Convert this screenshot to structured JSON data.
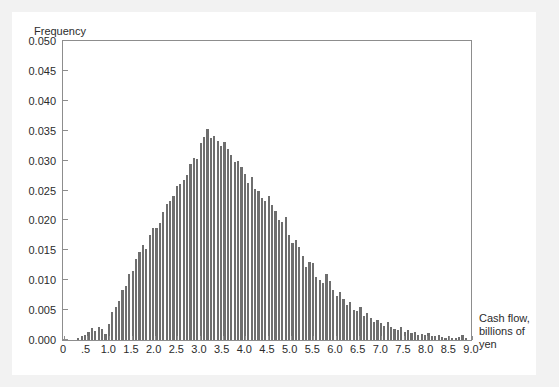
{
  "chart_data": {
    "type": "bar",
    "title": "",
    "annotation": "Year 10: 10,000 Trials",
    "xlabel": "Cash flow, billions of yen",
    "ylabel": "Frequency",
    "xlim": [
      0,
      9.0
    ],
    "ylim": [
      0,
      0.05
    ],
    "grid": false,
    "legend": null,
    "bar_color": "#6e6e6e",
    "frame_color": "#8d8d8d",
    "xtick_labels": [
      "0",
      ".5",
      "1.0",
      "1.5",
      "2.0",
      "2.5",
      "3.0",
      "3.5",
      "4.0",
      "4.5",
      "5.0",
      "5.5",
      "6.0",
      "6.5",
      "7.0",
      "7.5",
      "8.0",
      "8.5",
      "9.0"
    ],
    "xtick_values": [
      0,
      0.5,
      1.0,
      1.5,
      2.0,
      2.5,
      3.0,
      3.5,
      4.0,
      4.5,
      5.0,
      5.5,
      6.0,
      6.5,
      7.0,
      7.5,
      8.0,
      8.5,
      9.0
    ],
    "ytick_labels": [
      "0.000",
      "0.005",
      "0.010",
      "0.015",
      "0.020",
      "0.025",
      "0.030",
      "0.035",
      "0.040",
      "0.045",
      "0.050"
    ],
    "ytick_values": [
      0.0,
      0.005,
      0.01,
      0.015,
      0.02,
      0.025,
      0.03,
      0.035,
      0.04,
      0.045,
      0.05
    ],
    "bin_width": 0.075,
    "x": [
      0.3375,
      0.4125,
      0.4875,
      0.5625,
      0.6375,
      0.7125,
      0.7875,
      0.8625,
      0.9375,
      1.0125,
      1.0875,
      1.1625,
      1.2375,
      1.3125,
      1.3875,
      1.4625,
      1.5375,
      1.6125,
      1.6875,
      1.7625,
      1.8375,
      1.9125,
      1.9875,
      2.0625,
      2.1375,
      2.2125,
      2.2875,
      2.3625,
      2.4375,
      2.5125,
      2.5875,
      2.6625,
      2.7375,
      2.8125,
      2.8875,
      2.9625,
      3.0375,
      3.1125,
      3.1875,
      3.2625,
      3.3375,
      3.4125,
      3.4875,
      3.5625,
      3.6375,
      3.7125,
      3.7875,
      3.8625,
      3.9375,
      4.0125,
      4.0875,
      4.1625,
      4.2375,
      4.3125,
      4.3875,
      4.4625,
      4.5375,
      4.6125,
      4.6875,
      4.7625,
      4.8375,
      4.9125,
      4.9875,
      5.0625,
      5.1375,
      5.2125,
      5.2875,
      5.3625,
      5.4375,
      5.5125,
      5.5875,
      5.6625,
      5.7375,
      5.8125,
      5.8875,
      5.9625,
      6.0375,
      6.1125,
      6.1875,
      6.2625,
      6.3375,
      6.4125,
      6.4875,
      6.5625,
      6.6375,
      6.7125,
      6.7875,
      6.8625,
      6.9375,
      7.0125,
      7.0875,
      7.1625,
      7.2375,
      7.3125,
      7.3875,
      7.4625,
      7.5375,
      7.6125,
      7.6875,
      7.7625,
      7.8375,
      7.9125,
      7.9875,
      8.0625,
      8.1375,
      8.2125,
      8.2875,
      8.3625,
      8.4375,
      8.5125,
      8.5875,
      8.6625,
      8.7375,
      8.8125,
      8.8875
    ],
    "values": [
      0.0004,
      0.0006,
      0.0009,
      0.0013,
      0.002,
      0.0015,
      0.0022,
      0.0018,
      0.001,
      0.0026,
      0.0047,
      0.0056,
      0.0065,
      0.0083,
      0.0091,
      0.011,
      0.0116,
      0.0135,
      0.0147,
      0.0159,
      0.0153,
      0.0176,
      0.0188,
      0.0187,
      0.0196,
      0.0214,
      0.0227,
      0.0233,
      0.024,
      0.0258,
      0.0261,
      0.0268,
      0.0276,
      0.0295,
      0.0305,
      0.0303,
      0.033,
      0.0339,
      0.0353,
      0.0338,
      0.0341,
      0.0333,
      0.0325,
      0.0331,
      0.032,
      0.031,
      0.0298,
      0.03,
      0.0289,
      0.0277,
      0.0263,
      0.0272,
      0.0253,
      0.025,
      0.0238,
      0.0233,
      0.024,
      0.0225,
      0.0215,
      0.02,
      0.0197,
      0.0205,
      0.0176,
      0.0163,
      0.0168,
      0.0155,
      0.014,
      0.0122,
      0.013,
      0.0128,
      0.0105,
      0.01,
      0.0095,
      0.011,
      0.0098,
      0.0083,
      0.0073,
      0.008,
      0.0068,
      0.0058,
      0.0063,
      0.0051,
      0.0048,
      0.0055,
      0.004,
      0.0046,
      0.0036,
      0.003,
      0.0033,
      0.0028,
      0.0024,
      0.003,
      0.0022,
      0.0018,
      0.0016,
      0.0021,
      0.0014,
      0.0016,
      0.0011,
      0.0013,
      0.0009,
      0.001,
      0.0008,
      0.0012,
      0.0007,
      0.0006,
      0.0009,
      0.0005,
      0.0004,
      0.0006,
      0.0004,
      0.0003,
      0.0005,
      0.0008,
      0.0004
    ]
  }
}
